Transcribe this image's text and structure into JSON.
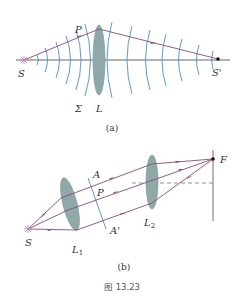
{
  "figure_a": {
    "labels": {
      "source": "S",
      "image": "S'",
      "point": "P",
      "wavefront": "Σ",
      "lens": "L"
    },
    "subcaption": "(a)"
  },
  "figure_b": {
    "labels": {
      "source": "S",
      "lens1": "L",
      "lens1_sub": "1",
      "lens2": "L",
      "lens2_sub": "2",
      "plane_top": "A",
      "plane_bottom": "A'",
      "point": "P",
      "focus": "F"
    },
    "subcaption": "(b)"
  },
  "caption": "图 13.23",
  "colors": {
    "ray": "#8a4a7a",
    "wavefront": "#4a90c8",
    "lens": "#8fa8a8",
    "axis": "#555555",
    "screen": "#999999"
  }
}
